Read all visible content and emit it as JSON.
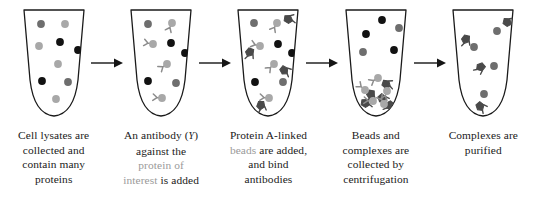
{
  "figure": {
    "background": "#ffffff",
    "palette": {
      "outline": "#1a1a1a",
      "text": "#1a1a1a",
      "muted_text": "#9a9a9a",
      "protein_dark_gray": "#6e6e6e",
      "protein_light_gray": "#a8a8a8",
      "protein_black": "#121212",
      "antibody": "#8c8c8c",
      "bead": "#4a4a4a",
      "arrow": "#151515"
    }
  },
  "stages": [
    {
      "id": "stage-1",
      "name": "cell-lysates",
      "caption_lines": [
        {
          "segments": [
            {
              "text": "Cell lysates are",
              "muted": false
            }
          ]
        },
        {
          "segments": [
            {
              "text": "collected and",
              "muted": false
            }
          ]
        },
        {
          "segments": [
            {
              "text": "contain many",
              "muted": false
            }
          ]
        },
        {
          "segments": [
            {
              "text": "proteins",
              "muted": false
            }
          ]
        }
      ],
      "tube_contents": {
        "proteins": [
          {
            "x": 25,
            "y": 18,
            "shade": "dark"
          },
          {
            "x": 49,
            "y": 18,
            "shade": "light"
          },
          {
            "x": 44,
            "y": 36,
            "shade": "black"
          },
          {
            "x": 23,
            "y": 40,
            "shade": "light"
          },
          {
            "x": 62,
            "y": 44,
            "shade": "black"
          },
          {
            "x": 42,
            "y": 58,
            "shade": "light"
          },
          {
            "x": 26,
            "y": 75,
            "shade": "black"
          },
          {
            "x": 52,
            "y": 76,
            "shade": "dark"
          },
          {
            "x": 40,
            "y": 93,
            "shade": "light"
          }
        ],
        "antibodies": [],
        "beads": []
      }
    },
    {
      "id": "stage-2",
      "name": "antibody-added",
      "caption_lines": [
        {
          "segments": [
            {
              "text": "An antibody (",
              "muted": false
            },
            {
              "text": "Y",
              "muted": false,
              "glyph": "antibody-glyph"
            },
            {
              "text": ")",
              "muted": false
            }
          ]
        },
        {
          "segments": [
            {
              "text": "against the",
              "muted": false
            }
          ]
        },
        {
          "segments": [
            {
              "text": "protein of",
              "muted": true
            }
          ]
        },
        {
          "segments": [
            {
              "text": "interest",
              "muted": true
            },
            {
              "text": " is added",
              "muted": false
            }
          ]
        }
      ],
      "tube_contents": {
        "proteins": [
          {
            "x": 25,
            "y": 18,
            "shade": "dark"
          },
          {
            "x": 49,
            "y": 17,
            "shade": "light"
          },
          {
            "x": 30,
            "y": 38,
            "shade": "light"
          },
          {
            "x": 48,
            "y": 37,
            "shade": "black"
          },
          {
            "x": 62,
            "y": 47,
            "shade": "black"
          },
          {
            "x": 44,
            "y": 58,
            "shade": "light"
          },
          {
            "x": 25,
            "y": 75,
            "shade": "black"
          },
          {
            "x": 53,
            "y": 77,
            "shade": "dark"
          },
          {
            "x": 39,
            "y": 92,
            "shade": "light"
          }
        ],
        "antibodies": [
          {
            "x": 49,
            "y": 17,
            "rot": 25
          },
          {
            "x": 30,
            "y": 38,
            "rot": 100
          },
          {
            "x": 44,
            "y": 58,
            "rot": 55
          },
          {
            "x": 39,
            "y": 92,
            "rot": 95
          }
        ],
        "beads": []
      }
    },
    {
      "id": "stage-3",
      "name": "protein-a-beads-added",
      "caption_lines": [
        {
          "segments": [
            {
              "text": "Protein A-linked",
              "muted": false
            }
          ]
        },
        {
          "segments": [
            {
              "text": "beads",
              "muted": true
            },
            {
              "text": " are added,",
              "muted": false
            }
          ]
        },
        {
          "segments": [
            {
              "text": "and bind",
              "muted": false
            }
          ]
        },
        {
          "segments": [
            {
              "text": "antibodies",
              "muted": false
            }
          ]
        }
      ],
      "tube_contents": {
        "proteins": [
          {
            "x": 24,
            "y": 17,
            "shade": "dark"
          },
          {
            "x": 47,
            "y": 17,
            "shade": "light"
          },
          {
            "x": 30,
            "y": 40,
            "shade": "light"
          },
          {
            "x": 48,
            "y": 38,
            "shade": "black"
          },
          {
            "x": 62,
            "y": 47,
            "shade": "black"
          },
          {
            "x": 44,
            "y": 58,
            "shade": "light"
          },
          {
            "x": 25,
            "y": 76,
            "shade": "black"
          },
          {
            "x": 53,
            "y": 76,
            "shade": "dark"
          },
          {
            "x": 39,
            "y": 92,
            "shade": "light"
          }
        ],
        "antibodies": [
          {
            "x": 47,
            "y": 17,
            "rot": 30
          },
          {
            "x": 30,
            "y": 40,
            "rot": 105
          },
          {
            "x": 44,
            "y": 58,
            "rot": 45
          },
          {
            "x": 39,
            "y": 92,
            "rot": 95
          }
        ],
        "beads": [
          {
            "x": 58,
            "y": 13,
            "rot": 20
          },
          {
            "x": 20,
            "y": 46,
            "rot": 120
          },
          {
            "x": 54,
            "y": 64,
            "rot": 50
          },
          {
            "x": 31,
            "y": 99,
            "rot": 100
          }
        ]
      }
    },
    {
      "id": "stage-4",
      "name": "centrifugation",
      "caption_lines": [
        {
          "segments": [
            {
              "text": "Beads and",
              "muted": false
            }
          ]
        },
        {
          "segments": [
            {
              "text": "complexes are",
              "muted": false
            }
          ]
        },
        {
          "segments": [
            {
              "text": "collected by",
              "muted": false
            }
          ]
        },
        {
          "segments": [
            {
              "text": "centrifugation",
              "muted": false
            }
          ]
        }
      ],
      "tube_contents": {
        "proteins": [
          {
            "x": 44,
            "y": 14,
            "shade": "black"
          },
          {
            "x": 61,
            "y": 22,
            "shade": "dark"
          },
          {
            "x": 28,
            "y": 28,
            "shade": "black"
          },
          {
            "x": 25,
            "y": 46,
            "shade": "dark"
          },
          {
            "x": 56,
            "y": 44,
            "shade": "black"
          },
          {
            "x": 40,
            "y": 72,
            "shade": "light"
          },
          {
            "x": 27,
            "y": 84,
            "shade": "light"
          },
          {
            "x": 49,
            "y": 85,
            "shade": "light"
          },
          {
            "x": 35,
            "y": 95,
            "shade": "light"
          },
          {
            "x": 46,
            "y": 98,
            "shade": "light"
          }
        ],
        "antibodies": [
          {
            "x": 40,
            "y": 72,
            "rot": 60
          },
          {
            "x": 27,
            "y": 84,
            "rot": 130
          },
          {
            "x": 49,
            "y": 85,
            "rot": 20
          },
          {
            "x": 35,
            "y": 95,
            "rot": 95
          },
          {
            "x": 46,
            "y": 98,
            "rot": 150
          }
        ],
        "beads": [
          {
            "x": 48,
            "y": 78,
            "rot": 30
          },
          {
            "x": 33,
            "y": 88,
            "rot": 110
          },
          {
            "x": 44,
            "y": 92,
            "rot": 60
          },
          {
            "x": 27,
            "y": 97,
            "rot": 20
          },
          {
            "x": 52,
            "y": 99,
            "rot": 140
          }
        ]
      }
    },
    {
      "id": "stage-5",
      "name": "complexes-purified",
      "caption_lines": [
        {
          "segments": [
            {
              "text": "Complexes are",
              "muted": false
            }
          ]
        },
        {
          "segments": [
            {
              "text": "purified",
              "muted": false
            }
          ]
        },
        {
          "segments": [
            {
              "text": "",
              "muted": false
            }
          ]
        },
        {
          "segments": [
            {
              "text": "",
              "muted": false
            }
          ]
        }
      ],
      "tube_contents": {
        "proteins": [
          {
            "x": 52,
            "y": 25,
            "shade": "dark"
          },
          {
            "x": 29,
            "y": 41,
            "shade": "dark"
          },
          {
            "x": 49,
            "y": 60,
            "shade": "dark"
          },
          {
            "x": 39,
            "y": 88,
            "shade": "dark"
          }
        ],
        "antibodies": [],
        "beads": [
          {
            "x": 62,
            "y": 16,
            "rot": 25
          },
          {
            "x": 21,
            "y": 33,
            "rot": 115
          },
          {
            "x": 36,
            "y": 61,
            "rot": 150
          },
          {
            "x": 35,
            "y": 100,
            "rot": 60
          }
        ]
      }
    }
  ],
  "arrows": [
    {
      "id": "arrow-1",
      "name": "arrow-stage1-to-stage2"
    },
    {
      "id": "arrow-2",
      "name": "arrow-stage2-to-stage3"
    },
    {
      "id": "arrow-3",
      "name": "arrow-stage3-to-stage4"
    },
    {
      "id": "arrow-4",
      "name": "arrow-stage4-to-stage5"
    }
  ]
}
